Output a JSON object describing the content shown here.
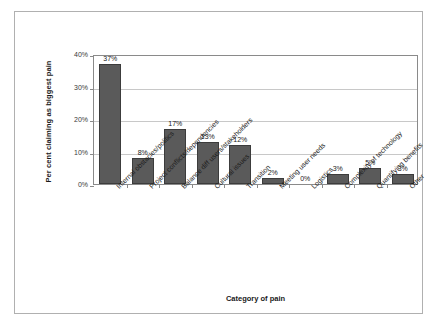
{
  "frame": {
    "border_color": "#b0b0b0",
    "background": "#ffffff"
  },
  "chart_data": {
    "type": "bar",
    "title": "",
    "xlabel": "Category of pain",
    "ylabel": "Per cent claiming as biggest pain",
    "categories": [
      "Internal obstacles/politics",
      "Project conflicts/dependencies",
      "Balance diff users/stakeholders",
      "Cultural issues",
      "Transition",
      "Meeting user needs",
      "Logistics",
      "Complexity of technology",
      "Quantifying benefits",
      "Other"
    ],
    "values": [
      37,
      8,
      17,
      13,
      12,
      2,
      0,
      3,
      5,
      3
    ],
    "value_labels": [
      "37%",
      "8%",
      "17%",
      "13%",
      "12%",
      "2%",
      "0%",
      "3%",
      "5%",
      "3%"
    ],
    "ylim": [
      0,
      40
    ],
    "ytick_values": [
      0,
      10,
      20,
      30,
      40
    ],
    "ytick_labels": [
      "0%",
      "10%",
      "20%",
      "30%",
      "40%"
    ],
    "grid": true,
    "legend": false,
    "bar_color": "#5a5a5a",
    "bar_border_color": "#3c3c3c",
    "gridline_color": "#c8c8c8",
    "axis_color": "#8a8a8a"
  }
}
